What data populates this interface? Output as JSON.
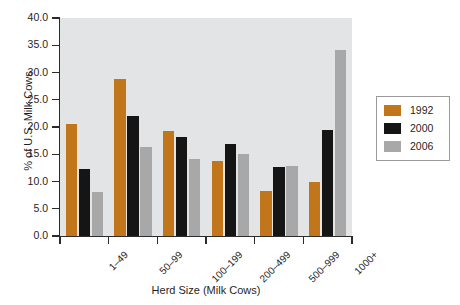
{
  "chart_data": {
    "type": "bar",
    "title": "",
    "xlabel": "Herd Size (Milk Cows)",
    "ylabel": "% of U.S. Milk Cows",
    "categories": [
      "1–49",
      "50–99",
      "100–199",
      "200–499",
      "500–999",
      "1000+"
    ],
    "series": [
      {
        "name": "1992",
        "color": "#c2761c",
        "values": [
          20.6,
          28.9,
          19.2,
          13.8,
          8.2,
          10.0
        ]
      },
      {
        "name": "2000",
        "color": "#151515",
        "values": [
          12.3,
          22.1,
          18.2,
          16.8,
          12.6,
          19.4
        ]
      },
      {
        "name": "2006",
        "color": "#a8a8a8",
        "values": [
          8.0,
          16.3,
          14.2,
          15.0,
          12.8,
          34.2
        ]
      }
    ],
    "ylim": [
      0,
      40
    ],
    "yticks": [
      0.0,
      5.0,
      10.0,
      15.0,
      20.0,
      25.0,
      30.0,
      35.0,
      40.0
    ],
    "ytick_labels": [
      "0.0",
      "5.0",
      "10.0",
      "15.0",
      "20.0",
      "25.0",
      "30.0",
      "35.0",
      "40.0"
    ],
    "grid": false,
    "legend_position": "right",
    "plot_background": "#e3e4e6",
    "figure_background": "#ffffff",
    "axis_color": "#2b2b2b"
  }
}
